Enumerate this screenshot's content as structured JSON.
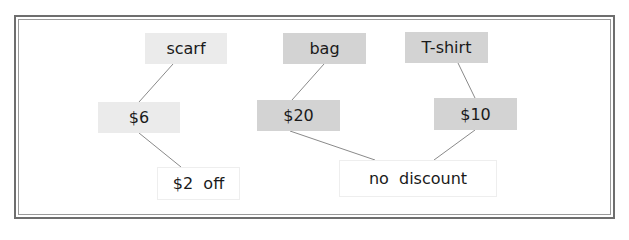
{
  "colors": {
    "light_node": "#ebebeb",
    "dark_node": "#d3d3d3",
    "result_node": "#ffffff",
    "line": "#8a8a8a",
    "frame": "#6e6e6e"
  },
  "nodes": {
    "scarf": {
      "label": "scarf"
    },
    "bag": {
      "label": "bag"
    },
    "tshirt": {
      "label": "T-shirt"
    },
    "price_scarf": {
      "label": "$6"
    },
    "price_bag": {
      "label": "$20"
    },
    "price_tshirt": {
      "label": "$10"
    },
    "result_scarf": {
      "label": "$2  off"
    },
    "result_other": {
      "label": "no  discount"
    }
  },
  "edges": [
    {
      "from": "scarf",
      "to": "price_scarf"
    },
    {
      "from": "price_scarf",
      "to": "result_scarf"
    },
    {
      "from": "bag",
      "to": "price_bag"
    },
    {
      "from": "tshirt",
      "to": "price_tshirt"
    },
    {
      "from": "price_bag",
      "to": "result_other"
    },
    {
      "from": "price_tshirt",
      "to": "result_other"
    }
  ]
}
